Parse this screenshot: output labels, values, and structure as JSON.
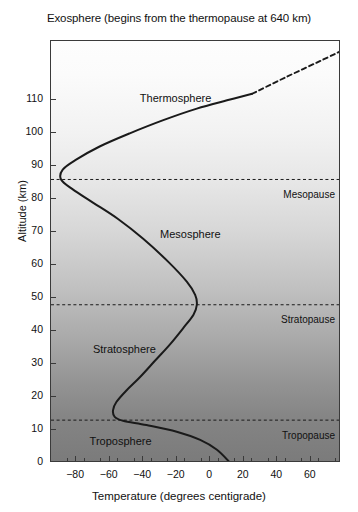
{
  "chart_data": {
    "type": "line",
    "title": "Exosphere (begins from the thermopause at 640 km)",
    "xlabel": "Temperature (degrees centigrade)",
    "ylabel": "Altitude (km)",
    "xlim": [
      -95,
      78
    ],
    "ylim": [
      0,
      128
    ],
    "xticks": [
      -80,
      -60,
      -40,
      -20,
      0,
      20,
      40,
      60
    ],
    "xtick_labels": [
      "−80",
      "−60",
      "−40",
      "−20",
      "0",
      "20",
      "40",
      "60"
    ],
    "yticks": [
      0,
      10,
      20,
      30,
      40,
      50,
      60,
      70,
      80,
      90,
      100,
      110
    ],
    "ytick_labels": [
      "0",
      "10",
      "20",
      "30",
      "40",
      "50",
      "60",
      "70",
      "80",
      "90",
      "100",
      "110"
    ],
    "grid": false,
    "legend": "none",
    "series": [
      {
        "name": "Temperature profile (solid)",
        "style": "solid",
        "points": [
          {
            "t": 12,
            "alt": 0
          },
          {
            "t": 4,
            "alt": 4
          },
          {
            "t": -6,
            "alt": 7
          },
          {
            "t": -20,
            "alt": 9.5
          },
          {
            "t": -38,
            "alt": 11.5
          },
          {
            "t": -52,
            "alt": 12.8
          },
          {
            "t": -57,
            "alt": 14
          },
          {
            "t": -58,
            "alt": 16
          },
          {
            "t": -56,
            "alt": 18.5
          },
          {
            "t": -50,
            "alt": 22
          },
          {
            "t": -42,
            "alt": 26
          },
          {
            "t": -33,
            "alt": 31
          },
          {
            "t": -24,
            "alt": 36
          },
          {
            "t": -16,
            "alt": 41
          },
          {
            "t": -10,
            "alt": 45
          },
          {
            "t": -8,
            "alt": 48
          },
          {
            "t": -9,
            "alt": 51
          },
          {
            "t": -14,
            "alt": 55
          },
          {
            "t": -25,
            "alt": 61
          },
          {
            "t": -40,
            "alt": 68
          },
          {
            "t": -55,
            "alt": 74
          },
          {
            "t": -70,
            "alt": 79
          },
          {
            "t": -82,
            "alt": 83
          },
          {
            "t": -89,
            "alt": 86
          },
          {
            "t": -88,
            "alt": 89
          },
          {
            "t": -80,
            "alt": 92
          },
          {
            "t": -66,
            "alt": 96
          },
          {
            "t": -48,
            "alt": 100
          },
          {
            "t": -28,
            "alt": 104
          },
          {
            "t": -8,
            "alt": 107.5
          },
          {
            "t": 10,
            "alt": 110
          },
          {
            "t": 25,
            "alt": 112
          }
        ]
      },
      {
        "name": "Thermosphere extrapolation (dashed)",
        "style": "dashed",
        "points": [
          {
            "t": 25,
            "alt": 112
          },
          {
            "t": 45,
            "alt": 117
          },
          {
            "t": 70,
            "alt": 123
          },
          {
            "t": 78,
            "alt": 125
          }
        ]
      }
    ],
    "boundaries": [
      {
        "name": "Mesopause",
        "alt": 86,
        "style": "dashed"
      },
      {
        "name": "Stratopause",
        "alt": 48,
        "style": "dashed"
      },
      {
        "name": "Tropopause",
        "alt": 13,
        "style": "dashed"
      }
    ],
    "layers": [
      {
        "name": "Thermosphere",
        "t": -42,
        "alt": 110
      },
      {
        "name": "Mesosphere",
        "t": -30,
        "alt": 69
      },
      {
        "name": "Stratosphere",
        "t": -70,
        "alt": 34
      },
      {
        "name": "Troposphere",
        "t": -72,
        "alt": 6
      }
    ],
    "annotations": [
      {
        "name": "Mesopause",
        "t": 52,
        "alt": 81
      },
      {
        "name": "Stratopause",
        "t": 50,
        "alt": 43
      },
      {
        "name": "Tropopause",
        "t": 52,
        "alt": 8
      }
    ],
    "colors": {
      "curve": "#1a1a1a",
      "frame": "#3a3a3a",
      "background_top": "#fdfdfd",
      "background_bottom": "#7b7b7b",
      "text": "#111111"
    }
  }
}
